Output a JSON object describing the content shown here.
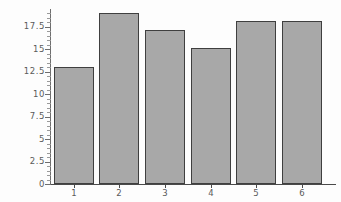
{
  "chart_data": {
    "type": "bar",
    "title": "",
    "subtitle": "",
    "xlabel": "",
    "ylabel": "",
    "categories": [
      "1",
      "2",
      "3",
      "4",
      "5",
      "6"
    ],
    "values": [
      13.0,
      19.0,
      17.2,
      15.1,
      18.1,
      18.1
    ],
    "ylim": [
      0,
      19.6
    ],
    "xlim": [
      0,
      6.25
    ],
    "y_ticks": [
      0,
      2.5,
      5,
      7.5,
      10,
      12.5,
      15,
      17.5
    ],
    "y_tick_labels": [
      "0",
      "2.5",
      "5",
      "7.5",
      "10",
      "12.5",
      "15",
      "17.5"
    ],
    "y_minor_ticks": [
      0.5,
      1.0,
      1.5,
      2.0,
      3.0,
      3.5,
      4.0,
      4.5,
      5.5,
      6.0,
      6.5,
      7.0,
      8.0,
      8.5,
      9.0,
      9.5,
      10.5,
      11.0,
      11.5,
      12.0,
      13.0,
      13.5,
      14.0,
      14.5,
      15.5,
      16.0,
      16.5,
      17.0,
      18.0,
      18.5,
      19.0
    ],
    "x_tick_labels": [
      "1",
      "2",
      "3",
      "4",
      "5",
      "6"
    ],
    "grid": false,
    "legend": null,
    "legend_position": "none",
    "bar_fill_color": "#a8a8a8",
    "bar_edge_color": "#3f3f3f",
    "axis_color": "#4a4a4a",
    "tick_label_color": "#5a5a5a",
    "background_color": "#fdfdfd",
    "annotations": []
  }
}
